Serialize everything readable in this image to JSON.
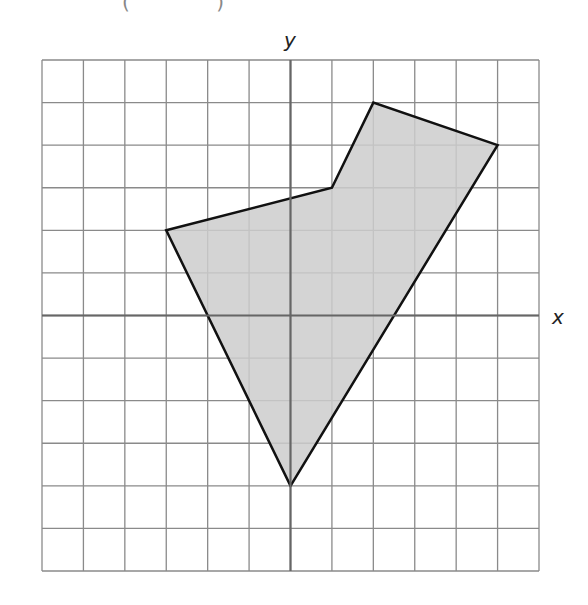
{
  "header": {
    "cropped_text": "( )"
  },
  "diagram": {
    "type": "coordinate-grid-polygon",
    "x_axis_label": "x",
    "y_axis_label": "y",
    "grid": {
      "x_min": -6,
      "x_max": 6,
      "y_min": -6,
      "y_max": 6,
      "step": 1
    },
    "polygon": {
      "vertices": [
        [
          -3,
          2
        ],
        [
          1,
          3
        ],
        [
          2,
          5
        ],
        [
          5,
          4
        ],
        [
          0,
          -4
        ]
      ],
      "fill_color": "#cccccc",
      "stroke_color": "#111111"
    },
    "colors": {
      "grid_line": "#8a8a8a",
      "axis_line": "#666666",
      "background": "#ffffff"
    }
  }
}
